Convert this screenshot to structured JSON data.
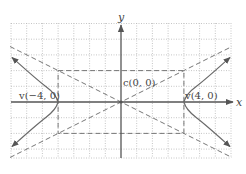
{
  "figure": {
    "axes": {
      "x_label": "x",
      "y_label": "y"
    },
    "labels": {
      "center": "c(0, 0)",
      "vertex_left": "v(−4, 0)",
      "vertex_right": "v(4, 0)"
    },
    "grid": {
      "x_min": -7,
      "x_max": 7,
      "y_min": -3.5,
      "y_max": 5,
      "step": 1
    },
    "hyperbola": {
      "a": 4,
      "b": 2,
      "center": [
        0,
        0
      ],
      "orientation": "horizontal"
    },
    "asymptotes": [
      "y = x/2",
      "y = -x/2"
    ],
    "fundamental_rectangle": {
      "x": [
        -4,
        4
      ],
      "y": [
        -2,
        2
      ]
    },
    "colors": {
      "grid": "#b8b8b8",
      "axis": "#555555",
      "curve": "#6a6a6a",
      "dashed": "#777777"
    }
  }
}
